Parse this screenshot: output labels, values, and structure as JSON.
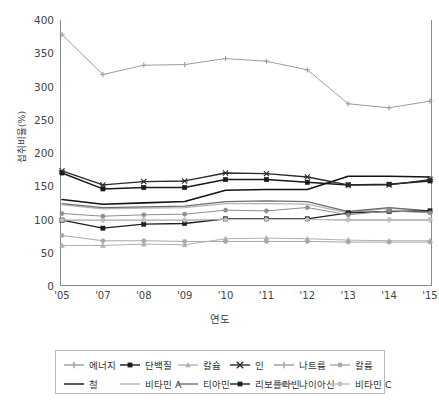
{
  "chart_data": {
    "type": "line",
    "title": "",
    "xlabel": "연도",
    "ylabel": "섭취비율(%)",
    "categories": [
      "'05",
      "'07",
      "'08",
      "'09",
      "'10",
      "'11",
      "'12",
      "'13",
      "'14",
      "'15"
    ],
    "ylim": [
      0,
      400
    ],
    "yticks": [
      0,
      50,
      100,
      150,
      200,
      250,
      300,
      350,
      400
    ],
    "grid": true,
    "legend_position": "bottom",
    "series": [
      {
        "name": "에너지",
        "color": "#9a9a9a",
        "marker": "plus",
        "width": 1.0,
        "values": [
          99,
          99,
          99,
          99,
          100,
          100,
          100,
          99,
          99,
          99
        ]
      },
      {
        "name": "단백질",
        "color": "#1a1a1a",
        "marker": "diamond",
        "width": 1.5,
        "values": [
          170,
          146,
          148,
          148,
          160,
          160,
          156,
          152,
          153,
          158
        ]
      },
      {
        "name": "칼슘",
        "color": "#b0b0b0",
        "marker": "triangle",
        "width": 1.0,
        "values": [
          61,
          61,
          63,
          62,
          71,
          72,
          71,
          69,
          68,
          68
        ]
      },
      {
        "name": "인",
        "color": "#2b2b2b",
        "marker": "cross",
        "width": 1.4,
        "values": [
          173,
          152,
          157,
          158,
          170,
          169,
          164,
          152,
          152,
          160
        ]
      },
      {
        "name": "나트륨",
        "color": "#9e9e9e",
        "marker": "plus",
        "width": 1.0,
        "values": [
          378,
          318,
          332,
          333,
          342,
          338,
          325,
          274,
          268,
          278
        ]
      },
      {
        "name": "칼륨",
        "color": "#a8a8a8",
        "marker": "dot",
        "width": 1.0,
        "values": [
          76,
          68,
          68,
          67,
          67,
          67,
          67,
          66,
          66,
          66
        ]
      },
      {
        "name": "철",
        "color": "#141414",
        "marker": "none",
        "width": 1.6,
        "values": [
          130,
          123,
          125,
          127,
          144,
          145,
          145,
          165,
          165,
          164
        ]
      },
      {
        "name": "비타민 A",
        "color": "#b5b5b5",
        "marker": "none",
        "width": 1.2,
        "values": [
          122,
          116,
          117,
          118,
          124,
          124,
          123,
          110,
          117,
          112
        ]
      },
      {
        "name": "티아민",
        "color": "#6e6e6e",
        "marker": "none",
        "width": 1.3,
        "values": [
          124,
          118,
          119,
          120,
          127,
          128,
          127,
          112,
          118,
          113
        ]
      },
      {
        "name": "리보플라빈",
        "color": "#1f1f1f",
        "marker": "diamond",
        "width": 1.3,
        "values": [
          99,
          87,
          93,
          94,
          101,
          101,
          101,
          110,
          112,
          113
        ]
      },
      {
        "name": "나이아신",
        "color": "#8f8f8f",
        "marker": "dot",
        "width": 1.0,
        "values": [
          109,
          105,
          107,
          108,
          114,
          113,
          118,
          107,
          113,
          110
        ]
      },
      {
        "name": "비타민 C",
        "color": "#c0c0c0",
        "marker": "dot",
        "width": 1.0,
        "values": [
          99,
          99,
          99,
          99,
          100,
          100,
          100,
          100,
          100,
          100
        ]
      }
    ]
  },
  "legend": {
    "rows": [
      [
        {
          "label": "에너지",
          "marker": "plus",
          "color": "#9a9a9a"
        },
        {
          "label": "단백질",
          "marker": "diamond",
          "color": "#1a1a1a"
        },
        {
          "label": "칼슘",
          "marker": "triangle",
          "color": "#b0b0b0"
        },
        {
          "label": "인",
          "marker": "cross",
          "color": "#2b2b2b"
        },
        {
          "label": "나트륨",
          "marker": "plus",
          "color": "#9e9e9e"
        },
        {
          "label": "칼륨",
          "marker": "dot",
          "color": "#a8a8a8"
        }
      ],
      [
        {
          "label": "철",
          "marker": "line",
          "color": "#141414"
        },
        {
          "label": "비타민 A",
          "marker": "line",
          "color": "#b5b5b5"
        },
        {
          "label": "티아민",
          "marker": "line",
          "color": "#6e6e6e"
        },
        {
          "label": "리보플라빈",
          "marker": "diamond",
          "color": "#1f1f1f"
        },
        {
          "label": "나이아신",
          "marker": "dot",
          "color": "#8f8f8f"
        },
        {
          "label": "비타민 C",
          "marker": "dot",
          "color": "#c0c0c0"
        }
      ]
    ]
  }
}
